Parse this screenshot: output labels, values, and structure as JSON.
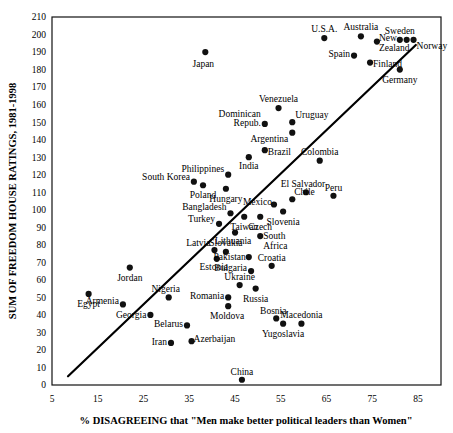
{
  "chart_data": {
    "type": "scatter",
    "title": "",
    "xlabel": "% DISAGREEING that \"Men make better political leaders than Women\"",
    "ylabel": "SUM OF FREEDOM HOUSE RATINGS, 1981-1998",
    "xlim": [
      5,
      90
    ],
    "ylim": [
      0,
      210
    ],
    "xticks": [
      5,
      15,
      25,
      35,
      45,
      55,
      65,
      75,
      85
    ],
    "yticks": [
      0,
      10,
      20,
      30,
      40,
      50,
      60,
      70,
      80,
      90,
      100,
      110,
      120,
      130,
      140,
      150,
      160,
      170,
      180,
      190,
      200,
      210
    ],
    "grid": false,
    "legend": "none",
    "trendline": {
      "x0": 8.5,
      "y0": 5,
      "x1": 84.5,
      "y1": 194
    },
    "points": [
      {
        "label": "Japan",
        "x": 38.5,
        "y": 190,
        "lx": -2,
        "ly": 15,
        "anchor": "middle"
      },
      {
        "label": "U.S.A.",
        "x": 64.5,
        "y": 198,
        "lx": 0,
        "ly": -6,
        "anchor": "middle"
      },
      {
        "label": "Australia",
        "x": 72.5,
        "y": 199,
        "lx": 0,
        "ly": -6,
        "anchor": "middle"
      },
      {
        "label": "New",
        "x": 76.0,
        "y": 196,
        "lx": 2,
        "ly": -1,
        "anchor": "start"
      },
      {
        "label": "Zealand",
        "x": 76.0,
        "y": 196,
        "lx": 2,
        "ly": 9,
        "anchor": "start",
        "nodot": true
      },
      {
        "label": "Sweden",
        "x": 81.0,
        "y": 197,
        "lx": 0,
        "ly": -6,
        "anchor": "middle"
      },
      {
        "label": "Norway",
        "x": 84.0,
        "y": 197,
        "lx": 3,
        "ly": 9,
        "anchor": "start"
      },
      {
        "label": "",
        "x": 82.5,
        "y": 197,
        "lx": 0,
        "ly": 0,
        "anchor": "middle"
      },
      {
        "label": "Spain",
        "x": 71.0,
        "y": 188,
        "lx": -4,
        "ly": 1,
        "anchor": "end"
      },
      {
        "label": "Finland",
        "x": 74.5,
        "y": 184,
        "lx": 3,
        "ly": 4,
        "anchor": "start"
      },
      {
        "label": "Germany",
        "x": 81.0,
        "y": 180,
        "lx": 0,
        "ly": 13,
        "anchor": "middle"
      },
      {
        "label": "Venezuela",
        "x": 54.5,
        "y": 158,
        "lx": 0,
        "ly": -6,
        "anchor": "middle"
      },
      {
        "label": "Dominican",
        "x": 51.5,
        "y": 149,
        "lx": -4,
        "ly": -7,
        "anchor": "end"
      },
      {
        "label": "Repub.",
        "x": 51.5,
        "y": 149,
        "lx": -4,
        "ly": 2,
        "anchor": "end",
        "nodot": true
      },
      {
        "label": "Uruguay",
        "x": 57.5,
        "y": 150,
        "lx": 3,
        "ly": -4,
        "anchor": "start"
      },
      {
        "label": "Argentina",
        "x": 57.5,
        "y": 144,
        "lx": -4,
        "ly": 9,
        "anchor": "end"
      },
      {
        "label": "Brazil",
        "x": 51.5,
        "y": 134,
        "lx": 3,
        "ly": 5,
        "anchor": "start"
      },
      {
        "label": "India",
        "x": 48.0,
        "y": 130,
        "lx": 0,
        "ly": 12,
        "anchor": "middle"
      },
      {
        "label": "Colombia",
        "x": 63.5,
        "y": 128,
        "lx": 0,
        "ly": -6,
        "anchor": "middle"
      },
      {
        "label": "Philippines",
        "x": 43.5,
        "y": 120,
        "lx": -4,
        "ly": -3,
        "anchor": "end"
      },
      {
        "label": "South Korea",
        "x": 36.0,
        "y": 116,
        "lx": -4,
        "ly": -2,
        "anchor": "end"
      },
      {
        "label": "Poland",
        "x": 38.0,
        "y": 114,
        "lx": 0,
        "ly": 13,
        "anchor": "middle"
      },
      {
        "label": "Hungary",
        "x": 43.0,
        "y": 112,
        "lx": 0,
        "ly": 13,
        "anchor": "middle"
      },
      {
        "label": "El Salvador",
        "x": 60.5,
        "y": 110,
        "lx": -3,
        "ly": -5,
        "anchor": "middle"
      },
      {
        "label": "Peru",
        "x": 66.5,
        "y": 108,
        "lx": 0,
        "ly": -5,
        "anchor": "middle"
      },
      {
        "label": "Chile",
        "x": 57.5,
        "y": 106,
        "lx": 2,
        "ly": -4,
        "anchor": "start"
      },
      {
        "label": "Mexico",
        "x": 53.5,
        "y": 103,
        "lx": -2,
        "ly": 0,
        "anchor": "end"
      },
      {
        "label": "Taiwan",
        "x": 47.0,
        "y": 96,
        "lx": 0,
        "ly": 13,
        "anchor": "middle"
      },
      {
        "label": "Slovenia",
        "x": 55.5,
        "y": 99,
        "lx": 0,
        "ly": 13,
        "anchor": "middle"
      },
      {
        "label": "Bangladesh",
        "x": 44.0,
        "y": 98,
        "lx": -4,
        "ly": -3,
        "anchor": "end"
      },
      {
        "label": "Czech",
        "x": 50.5,
        "y": 96,
        "lx": 0,
        "ly": 13,
        "anchor": "middle"
      },
      {
        "label": "Turkey",
        "x": 41.5,
        "y": 92,
        "lx": -4,
        "ly": -2,
        "anchor": "end"
      },
      {
        "label": "Lithuania",
        "x": 45.0,
        "y": 87,
        "lx": -2,
        "ly": 11,
        "anchor": "middle"
      },
      {
        "label": "South",
        "x": 50.5,
        "y": 85,
        "lx": 3,
        "ly": 3,
        "anchor": "start"
      },
      {
        "label": "Africa",
        "x": 50.5,
        "y": 85,
        "lx": 3,
        "ly": 13,
        "anchor": "start",
        "nodot": true
      },
      {
        "label": "Latvia",
        "x": 40.5,
        "y": 77,
        "lx": -4,
        "ly": -4,
        "anchor": "end"
      },
      {
        "label": "Slovakia",
        "x": 43.0,
        "y": 76,
        "lx": 0,
        "ly": -6,
        "anchor": "middle"
      },
      {
        "label": "Estonia",
        "x": 41.0,
        "y": 72,
        "lx": -3,
        "ly": 11,
        "anchor": "middle"
      },
      {
        "label": "Pakistan",
        "x": 48.0,
        "y": 73,
        "lx": -3,
        "ly": 3,
        "anchor": "end"
      },
      {
        "label": "Croatia",
        "x": 53.0,
        "y": 68,
        "lx": 0,
        "ly": -5,
        "anchor": "middle"
      },
      {
        "label": "Bulgaria",
        "x": 48.5,
        "y": 65,
        "lx": -4,
        "ly": 0,
        "anchor": "end"
      },
      {
        "label": "Jordan",
        "x": 22.0,
        "y": 67,
        "lx": 0,
        "ly": 13,
        "anchor": "middle"
      },
      {
        "label": "Ukraine",
        "x": 46.0,
        "y": 57,
        "lx": 0,
        "ly": -5,
        "anchor": "middle"
      },
      {
        "label": "Russia",
        "x": 49.5,
        "y": 55,
        "lx": 0,
        "ly": 13,
        "anchor": "middle"
      },
      {
        "label": "Egypt",
        "x": 13.0,
        "y": 52,
        "lx": 0,
        "ly": 13,
        "anchor": "middle"
      },
      {
        "label": "Nigeria",
        "x": 30.5,
        "y": 50,
        "lx": -3,
        "ly": -5,
        "anchor": "middle"
      },
      {
        "label": "Romania",
        "x": 43.5,
        "y": 50,
        "lx": -4,
        "ly": 2,
        "anchor": "end"
      },
      {
        "label": "Armenia",
        "x": 20.5,
        "y": 46,
        "lx": -4,
        "ly": 0,
        "anchor": "end"
      },
      {
        "label": "Moldova",
        "x": 43.5,
        "y": 45,
        "lx": -1,
        "ly": 13,
        "anchor": "middle"
      },
      {
        "label": "Georgia",
        "x": 26.5,
        "y": 40,
        "lx": -4,
        "ly": 3,
        "anchor": "end"
      },
      {
        "label": "Bosnia",
        "x": 54.0,
        "y": 38,
        "lx": -3,
        "ly": -4,
        "anchor": "middle"
      },
      {
        "label": "Macedonia",
        "x": 59.5,
        "y": 35,
        "lx": 0,
        "ly": -6,
        "anchor": "middle"
      },
      {
        "label": "Yugoslavia",
        "x": 55.5,
        "y": 35,
        "lx": 0,
        "ly": 13,
        "anchor": "middle"
      },
      {
        "label": "Belarus",
        "x": 34.5,
        "y": 34,
        "lx": -4,
        "ly": 2,
        "anchor": "end"
      },
      {
        "label": "Iran",
        "x": 31.0,
        "y": 24,
        "lx": -4,
        "ly": 2,
        "anchor": "end"
      },
      {
        "label": "Azerbaijan",
        "x": 35.5,
        "y": 25,
        "lx": 2,
        "ly": 1,
        "anchor": "start"
      },
      {
        "label": "China",
        "x": 46.5,
        "y": 3,
        "lx": 0,
        "ly": -5,
        "anchor": "middle"
      }
    ]
  }
}
